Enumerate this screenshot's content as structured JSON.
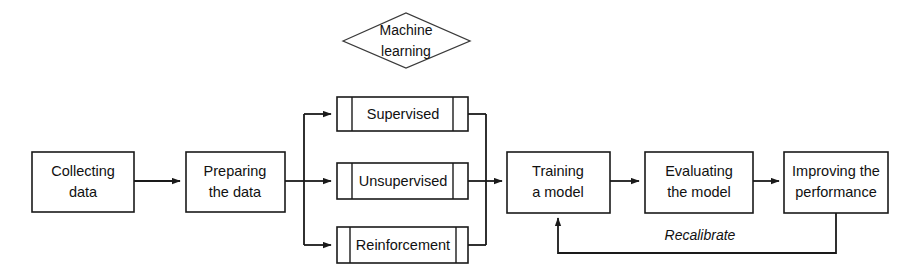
{
  "diagram": {
    "background_color": "#ffffff",
    "line_color": "#1a1a1a",
    "text_color": "#111111",
    "decision": {
      "shape": "diamond",
      "label_line1": "Machine",
      "label_line2": "learning"
    },
    "stages": [
      {
        "id": "collecting",
        "shape": "process",
        "label_line1": "Collecting",
        "label_line2": "data"
      },
      {
        "id": "preparing",
        "shape": "process",
        "label_line1": "Preparing",
        "label_line2": "the data"
      },
      {
        "id": "training",
        "shape": "process",
        "label_line1": "Training",
        "label_line2": "a model"
      },
      {
        "id": "evaluating",
        "shape": "process",
        "label_line1": "Evaluating",
        "label_line2": "the model"
      },
      {
        "id": "improving",
        "shape": "process",
        "label_line1": "Improving the",
        "label_line2": "performance"
      }
    ],
    "branches": [
      {
        "id": "supervised",
        "shape": "predefined-process",
        "label": "Supervised"
      },
      {
        "id": "unsupervised",
        "shape": "predefined-process",
        "label": "Unsupervised"
      },
      {
        "id": "reinforcement",
        "shape": "predefined-process",
        "label": "Reinforcement"
      }
    ],
    "feedback": {
      "id": "recalibrate",
      "label": "Recalibrate",
      "style": "italic",
      "from": "improving",
      "to": "training"
    }
  }
}
